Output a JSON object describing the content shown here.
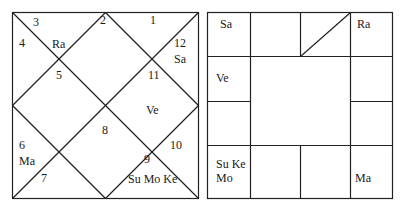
{
  "north_chart": {
    "houses": [
      {
        "num": "1",
        "x": 150,
        "y": 14
      },
      {
        "num": "2",
        "x": 100,
        "y": 14
      },
      {
        "num": "3",
        "x": 33,
        "y": 16
      },
      {
        "num": "4",
        "x": 19,
        "y": 37
      },
      {
        "num": "5",
        "x": 56,
        "y": 69
      },
      {
        "num": "6",
        "x": 19,
        "y": 139
      },
      {
        "num": "7",
        "x": 41,
        "y": 172
      },
      {
        "num": "8",
        "x": 102,
        "y": 124
      },
      {
        "num": "9",
        "x": 144,
        "y": 153
      },
      {
        "num": "10",
        "x": 170,
        "y": 139
      },
      {
        "num": "11",
        "x": 148,
        "y": 69
      },
      {
        "num": "12",
        "x": 174,
        "y": 37
      }
    ],
    "planets": [
      {
        "text": "Ra",
        "x": 52,
        "y": 38
      },
      {
        "text": "Sa",
        "x": 174,
        "y": 53
      },
      {
        "text": "Ve",
        "x": 146,
        "y": 104
      },
      {
        "text": "Ma",
        "x": 19,
        "y": 155
      },
      {
        "text": "Su Mo Ke",
        "x": 128,
        "y": 173
      }
    ]
  },
  "south_chart": {
    "cells": [
      {
        "text": "Sa",
        "x": 220,
        "y": 18
      },
      {
        "text": "Ra",
        "x": 357,
        "y": 18
      },
      {
        "text": "Ve",
        "x": 216,
        "y": 72
      },
      {
        "text": "Su Ke",
        "x": 216,
        "y": 158
      },
      {
        "text": "Mo",
        "x": 216,
        "y": 172
      },
      {
        "text": "Ma",
        "x": 355,
        "y": 172
      }
    ]
  }
}
